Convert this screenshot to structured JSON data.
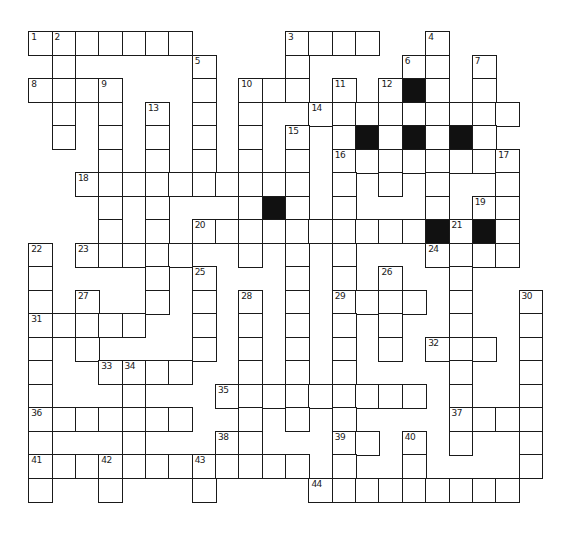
{
  "puzzle": {
    "type": "crossword",
    "grid_origin": {
      "x": 29,
      "y": 32
    },
    "cell_size": {
      "w": 23.35,
      "h": 23.5
    },
    "colors": {
      "line": "#1a1a1a",
      "block": "#111111",
      "background": "#ffffff"
    },
    "rows": [
      {
        "r": 0,
        "cells": [
          0,
          1,
          2,
          3,
          4,
          5,
          6,
          11,
          12,
          13,
          14,
          17
        ],
        "black": []
      },
      {
        "r": 1,
        "cells": [
          1,
          7,
          11,
          16,
          17,
          19
        ],
        "black": []
      },
      {
        "r": 2,
        "cells": [
          0,
          1,
          2,
          3,
          7,
          9,
          10,
          11,
          13,
          15,
          16,
          17,
          19
        ],
        "black": [
          16
        ]
      },
      {
        "r": 3,
        "cells": [
          1,
          3,
          5,
          7,
          9,
          12,
          13,
          14,
          15,
          16,
          17,
          18,
          19,
          20
        ],
        "black": []
      },
      {
        "r": 4,
        "cells": [
          1,
          3,
          5,
          7,
          9,
          11,
          13,
          14,
          15,
          16,
          17,
          18,
          19
        ],
        "black": [
          14,
          16,
          18
        ]
      },
      {
        "r": 5,
        "cells": [
          3,
          5,
          7,
          9,
          11,
          13,
          14,
          15,
          16,
          17,
          18,
          19,
          20
        ],
        "black": []
      },
      {
        "r": 6,
        "cells": [
          2,
          3,
          4,
          5,
          6,
          7,
          8,
          9,
          10,
          11,
          13,
          15,
          17,
          20
        ],
        "black": []
      },
      {
        "r": 7,
        "cells": [
          3,
          5,
          9,
          10,
          11,
          13,
          17,
          19,
          20
        ],
        "black": [
          10
        ]
      },
      {
        "r": 8,
        "cells": [
          3,
          5,
          7,
          8,
          9,
          10,
          11,
          12,
          13,
          14,
          15,
          16,
          17,
          18,
          19,
          20
        ],
        "black": [
          17,
          19
        ]
      },
      {
        "r": 9,
        "cells": [
          0,
          2,
          3,
          4,
          5,
          6,
          9,
          11,
          13,
          17,
          18,
          19,
          20
        ],
        "black": []
      },
      {
        "r": 10,
        "cells": [
          0,
          5,
          7,
          11,
          13,
          15,
          18
        ],
        "black": []
      },
      {
        "r": 11,
        "cells": [
          0,
          2,
          5,
          7,
          9,
          11,
          13,
          14,
          15,
          16,
          18,
          21
        ],
        "black": []
      },
      {
        "r": 12,
        "cells": [
          0,
          1,
          2,
          3,
          4,
          7,
          9,
          11,
          13,
          15,
          18,
          21
        ],
        "black": []
      },
      {
        "r": 13,
        "cells": [
          0,
          2,
          7,
          9,
          11,
          13,
          15,
          17,
          18,
          19,
          21
        ],
        "black": []
      },
      {
        "r": 14,
        "cells": [
          0,
          3,
          4,
          5,
          6,
          9,
          11,
          13,
          18,
          21
        ],
        "black": []
      },
      {
        "r": 15,
        "cells": [
          0,
          4,
          8,
          9,
          10,
          11,
          12,
          13,
          14,
          15,
          16,
          18,
          21
        ],
        "black": []
      },
      {
        "r": 16,
        "cells": [
          0,
          1,
          2,
          3,
          4,
          5,
          6,
          9,
          11,
          13,
          18,
          19,
          20,
          21
        ],
        "black": []
      },
      {
        "r": 17,
        "cells": [
          0,
          4,
          8,
          9,
          13,
          14,
          16,
          18,
          21
        ],
        "black": []
      },
      {
        "r": 18,
        "cells": [
          0,
          1,
          2,
          3,
          4,
          5,
          6,
          7,
          8,
          9,
          10,
          11,
          13,
          16,
          21
        ],
        "black": []
      },
      {
        "r": 19,
        "cells": [
          0,
          3,
          7,
          12,
          13,
          14,
          15,
          16,
          17,
          18,
          19,
          20
        ],
        "black": []
      }
    ],
    "numbers": [
      {
        "n": "1",
        "r": 0,
        "c": 0
      },
      {
        "n": "2",
        "r": 0,
        "c": 1
      },
      {
        "n": "3",
        "r": 0,
        "c": 11
      },
      {
        "n": "4",
        "r": 0,
        "c": 17
      },
      {
        "n": "5",
        "r": 1,
        "c": 7
      },
      {
        "n": "6",
        "r": 1,
        "c": 16
      },
      {
        "n": "7",
        "r": 1,
        "c": 19
      },
      {
        "n": "8",
        "r": 2,
        "c": 0
      },
      {
        "n": "9",
        "r": 2,
        "c": 3
      },
      {
        "n": "10",
        "r": 2,
        "c": 9
      },
      {
        "n": "11",
        "r": 2,
        "c": 13
      },
      {
        "n": "12",
        "r": 2,
        "c": 15
      },
      {
        "n": "13",
        "r": 3,
        "c": 5
      },
      {
        "n": "14",
        "r": 3,
        "c": 12
      },
      {
        "n": "15",
        "r": 4,
        "c": 11
      },
      {
        "n": "16",
        "r": 5,
        "c": 13
      },
      {
        "n": "17",
        "r": 5,
        "c": 20
      },
      {
        "n": "18",
        "r": 6,
        "c": 2
      },
      {
        "n": "19",
        "r": 7,
        "c": 19
      },
      {
        "n": "20",
        "r": 8,
        "c": 7
      },
      {
        "n": "21",
        "r": 8,
        "c": 18
      },
      {
        "n": "22",
        "r": 9,
        "c": 0
      },
      {
        "n": "23",
        "r": 9,
        "c": 2
      },
      {
        "n": "24",
        "r": 9,
        "c": 17
      },
      {
        "n": "25",
        "r": 10,
        "c": 7
      },
      {
        "n": "26",
        "r": 10,
        "c": 15
      },
      {
        "n": "27",
        "r": 11,
        "c": 2
      },
      {
        "n": "28",
        "r": 11,
        "c": 9
      },
      {
        "n": "29",
        "r": 11,
        "c": 13
      },
      {
        "n": "30",
        "r": 11,
        "c": 21
      },
      {
        "n": "31",
        "r": 12,
        "c": 0
      },
      {
        "n": "32",
        "r": 13,
        "c": 17
      },
      {
        "n": "33",
        "r": 14,
        "c": 3
      },
      {
        "n": "34",
        "r": 14,
        "c": 4
      },
      {
        "n": "35",
        "r": 15,
        "c": 8
      },
      {
        "n": "36",
        "r": 16,
        "c": 0
      },
      {
        "n": "37",
        "r": 16,
        "c": 18
      },
      {
        "n": "38",
        "r": 17,
        "c": 8
      },
      {
        "n": "39",
        "r": 17,
        "c": 13
      },
      {
        "n": "40",
        "r": 17,
        "c": 16
      },
      {
        "n": "41",
        "r": 18,
        "c": 0
      },
      {
        "n": "42",
        "r": 18,
        "c": 3
      },
      {
        "n": "43",
        "r": 18,
        "c": 7
      },
      {
        "n": "44",
        "r": 19,
        "c": 12
      }
    ]
  }
}
